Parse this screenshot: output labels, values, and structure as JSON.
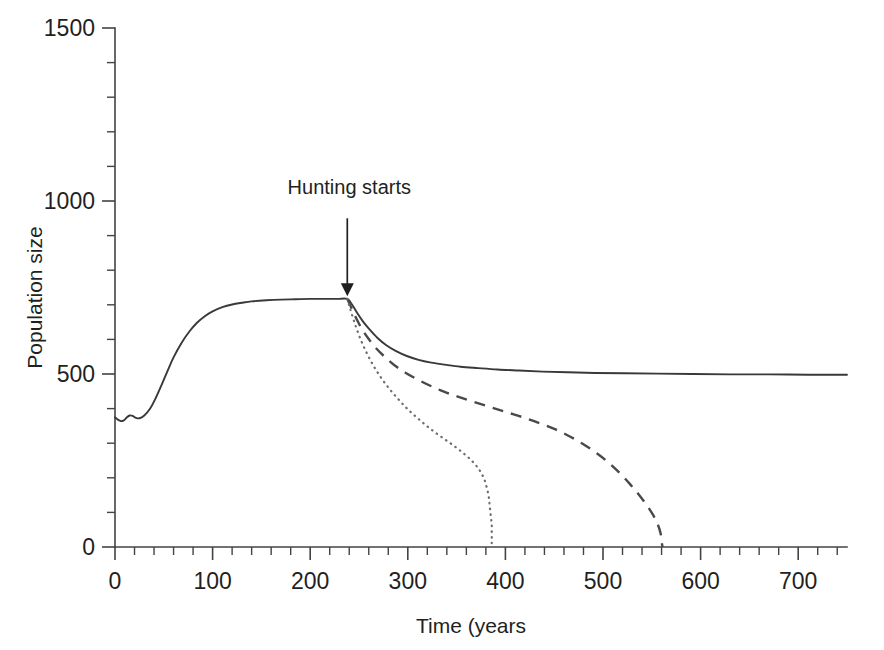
{
  "figure": {
    "background_color": "#ffffff",
    "ink_color": "#231f20"
  },
  "chart_data": {
    "type": "line",
    "title": "",
    "xlabel": "Time (years",
    "ylabel": "Population size",
    "xlim": [
      0,
      750
    ],
    "ylim": [
      0,
      1500
    ],
    "grid": false,
    "legend": "none",
    "x_major_ticks": [
      0,
      100,
      200,
      300,
      400,
      500,
      600,
      700
    ],
    "x_major_tick_labels": [
      "0",
      "100",
      "200",
      "300",
      "400",
      "500",
      "600",
      "700"
    ],
    "x_minor_tick_interval": 20,
    "y_major_ticks": [
      0,
      500,
      1000,
      1500
    ],
    "y_major_tick_labels": [
      "0",
      "500",
      "1000",
      "1500"
    ],
    "y_minor_tick_interval": 100,
    "annotations": [
      {
        "name": "hunting-starts",
        "text": "Hunting starts",
        "x": 238,
        "y_text": 1020,
        "arrow_from_y": 950,
        "arrow_to_y": 725
      }
    ],
    "series": [
      {
        "name": "no-hunting-sustainable",
        "style": "solid",
        "color": "#3a383a",
        "description": "Population recovers and stabilises near 500 after hunting starts",
        "points": [
          [
            0,
            375
          ],
          [
            3,
            368
          ],
          [
            6,
            364
          ],
          [
            9,
            366
          ],
          [
            12,
            374
          ],
          [
            15,
            380
          ],
          [
            18,
            379
          ],
          [
            21,
            374
          ],
          [
            25,
            372
          ],
          [
            30,
            380
          ],
          [
            36,
            400
          ],
          [
            42,
            432
          ],
          [
            48,
            470
          ],
          [
            54,
            510
          ],
          [
            60,
            548
          ],
          [
            68,
            589
          ],
          [
            76,
            622
          ],
          [
            84,
            648
          ],
          [
            92,
            667
          ],
          [
            100,
            681
          ],
          [
            110,
            693
          ],
          [
            120,
            701
          ],
          [
            130,
            706
          ],
          [
            140,
            710
          ],
          [
            155,
            713
          ],
          [
            170,
            715
          ],
          [
            185,
            716
          ],
          [
            200,
            717
          ],
          [
            215,
            717
          ],
          [
            228,
            717
          ],
          [
            238,
            717
          ],
          [
            243,
            700
          ],
          [
            248,
            677
          ],
          [
            254,
            652
          ],
          [
            261,
            628
          ],
          [
            269,
            604
          ],
          [
            278,
            583
          ],
          [
            288,
            566
          ],
          [
            299,
            552
          ],
          [
            311,
            541
          ],
          [
            324,
            533
          ],
          [
            338,
            527
          ],
          [
            354,
            521
          ],
          [
            372,
            517
          ],
          [
            392,
            513
          ],
          [
            414,
            510
          ],
          [
            438,
            507
          ],
          [
            464,
            505
          ],
          [
            492,
            503
          ],
          [
            522,
            502
          ],
          [
            556,
            501
          ],
          [
            592,
            500
          ],
          [
            630,
            499
          ],
          [
            670,
            499
          ],
          [
            710,
            498
          ],
          [
            750,
            498
          ]
        ]
      },
      {
        "name": "moderate-overharvest",
        "style": "dashed",
        "color": "#4a484a",
        "description": "Population declines steadily and goes extinct around year 560",
        "points": [
          [
            238,
            717
          ],
          [
            242,
            692
          ],
          [
            247,
            662
          ],
          [
            253,
            630
          ],
          [
            260,
            601
          ],
          [
            268,
            573
          ],
          [
            277,
            548
          ],
          [
            287,
            524
          ],
          [
            298,
            503
          ],
          [
            310,
            484
          ],
          [
            323,
            466
          ],
          [
            337,
            449
          ],
          [
            352,
            434
          ],
          [
            368,
            419
          ],
          [
            385,
            404
          ],
          [
            402,
            389
          ],
          [
            419,
            374
          ],
          [
            436,
            357
          ],
          [
            452,
            339
          ],
          [
            467,
            318
          ],
          [
            481,
            295
          ],
          [
            494,
            270
          ],
          [
            506,
            243
          ],
          [
            517,
            214
          ],
          [
            527,
            184
          ],
          [
            536,
            154
          ],
          [
            544,
            124
          ],
          [
            551,
            94
          ],
          [
            556,
            66
          ],
          [
            559,
            40
          ],
          [
            560,
            16
          ],
          [
            561,
            0
          ]
        ]
      },
      {
        "name": "heavy-overharvest",
        "style": "dotted",
        "color": "#6e6c6e",
        "description": "Population crashes rapidly and goes extinct around year 385",
        "points": [
          [
            238,
            717
          ],
          [
            241,
            688
          ],
          [
            245,
            652
          ],
          [
            250,
            612
          ],
          [
            256,
            572
          ],
          [
            263,
            533
          ],
          [
            271,
            496
          ],
          [
            280,
            461
          ],
          [
            290,
            428
          ],
          [
            300,
            398
          ],
          [
            311,
            370
          ],
          [
            322,
            344
          ],
          [
            334,
            319
          ],
          [
            346,
            295
          ],
          [
            357,
            271
          ],
          [
            366,
            248
          ],
          [
            373,
            224
          ],
          [
            378,
            198
          ],
          [
            381,
            171
          ],
          [
            383,
            144
          ],
          [
            384,
            117
          ],
          [
            385,
            90
          ],
          [
            386,
            64
          ],
          [
            386,
            40
          ],
          [
            386,
            18
          ],
          [
            386,
            0
          ]
        ]
      }
    ]
  }
}
